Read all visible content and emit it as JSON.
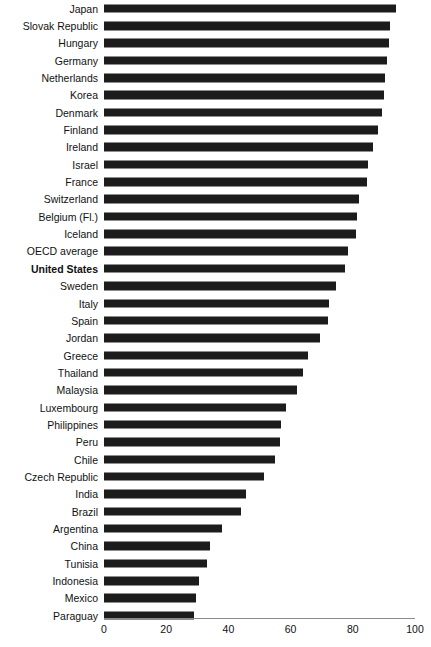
{
  "chart_data": {
    "type": "bar",
    "orientation": "horizontal",
    "title": "",
    "subtitle": "",
    "xlabel": "",
    "ylabel": "",
    "xlim": [
      0,
      100
    ],
    "grid": false,
    "legend": null,
    "bar_color": "#1c1c1c",
    "highlight_category": "United States",
    "axis_ticks": [
      0,
      20,
      40,
      60,
      80,
      100
    ],
    "axis_tick_labels": [
      "0",
      "20",
      "40",
      "60",
      "80",
      "100"
    ],
    "categories": [
      "Japan",
      "Slovak Republic",
      "Hungary",
      "Germany",
      "Netherlands",
      "Korea",
      "Denmark",
      "Finland",
      "Ireland",
      "Israel",
      "France",
      "Switzerland",
      "Belgium (Fl.)",
      "Iceland",
      "OECD average",
      "United States",
      "Sweden",
      "Italy",
      "Spain",
      "Jordan",
      "Greece",
      "Thailand",
      "Malaysia",
      "Luxembourg",
      "Philippines",
      "Peru",
      "Chile",
      "Czech Republic",
      "India",
      "Brazil",
      "Argentina",
      "China",
      "Tunisia",
      "Indonesia",
      "Mexico",
      "Paraguay"
    ],
    "values": [
      94.0,
      92.0,
      91.5,
      91.0,
      90.5,
      90.0,
      89.5,
      88.0,
      86.5,
      85.0,
      84.5,
      82.0,
      81.5,
      81.0,
      78.5,
      77.5,
      74.5,
      72.5,
      72.0,
      69.5,
      65.5,
      64.0,
      62.0,
      58.5,
      57.0,
      56.5,
      55.0,
      51.5,
      45.5,
      44.0,
      38.0,
      34.0,
      33.0,
      30.5,
      29.5,
      29.0
    ]
  }
}
